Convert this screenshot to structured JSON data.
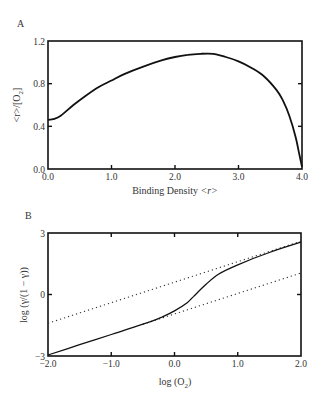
{
  "chart_data": [
    {
      "panel": "A",
      "type": "line",
      "title": "",
      "xlabel": "Binding Density <r>",
      "ylabel": "<r>/[O2]",
      "xlim": [
        0.0,
        4.0
      ],
      "ylim": [
        0.0,
        1.2
      ],
      "xticks": [
        "0.0",
        "1.0",
        "2.0",
        "3.0",
        "4.0"
      ],
      "yticks": [
        "0.0",
        "0.4",
        "0.8",
        "1.2"
      ],
      "grid": false,
      "series": [
        {
          "name": "Scatchard plot",
          "style": "solid",
          "x": [
            0.0,
            0.1,
            0.2,
            0.4,
            0.6,
            0.8,
            1.0,
            1.2,
            1.5,
            1.8,
            2.0,
            2.2,
            2.4,
            2.6,
            2.8,
            3.0,
            3.2,
            3.4,
            3.6,
            3.7,
            3.8,
            3.9,
            3.95,
            4.0
          ],
          "y": [
            0.46,
            0.47,
            0.5,
            0.6,
            0.69,
            0.77,
            0.83,
            0.89,
            0.96,
            1.02,
            1.05,
            1.07,
            1.08,
            1.08,
            1.05,
            1.01,
            0.95,
            0.87,
            0.74,
            0.64,
            0.5,
            0.3,
            0.16,
            0.02
          ]
        }
      ]
    },
    {
      "panel": "B",
      "type": "line",
      "title": "",
      "xlabel": "log (O2)",
      "ylabel": "log (Y/(1 − Y))",
      "xlim": [
        -2.0,
        2.0
      ],
      "ylim": [
        -3,
        3
      ],
      "xticks": [
        "−2.0",
        "−1.0",
        "0.0",
        "1.0",
        "2.0"
      ],
      "yticks": [
        "−3",
        "0",
        "3"
      ],
      "grid": false,
      "series": [
        {
          "name": "Hill plot",
          "style": "solid",
          "x": [
            -2.0,
            -1.5,
            -1.0,
            -0.5,
            -0.2,
            0.0,
            0.2,
            0.3,
            0.5,
            0.7,
            1.0,
            1.5,
            2.0
          ],
          "y": [
            -2.95,
            -2.45,
            -1.95,
            -1.45,
            -1.1,
            -0.8,
            -0.4,
            -0.1,
            0.5,
            1.0,
            1.45,
            2.05,
            2.55
          ]
        },
        {
          "name": "Upper asymptote (slope 1)",
          "style": "dotted",
          "x": [
            -2.0,
            2.0
          ],
          "y": [
            -1.4,
            2.6
          ]
        },
        {
          "name": "Lower asymptote (slope 1)",
          "style": "dotted",
          "x": [
            -0.5,
            2.0
          ],
          "y": [
            -1.45,
            1.05
          ]
        }
      ]
    }
  ],
  "panels": {
    "a": {
      "label": "A",
      "xlabel_text": "Binding Density ",
      "xlabel_var": "<r>",
      "ylabel_text": "<r>/[O",
      "ylabel_sub": "2",
      "ylabel_end": "]",
      "xticks": [
        "0.0",
        "1.0",
        "2.0",
        "3.0",
        "4.0"
      ],
      "yticks": [
        "0.0",
        "0.4",
        "0.8",
        "1.2"
      ]
    },
    "b": {
      "label": "B",
      "xlabel_text": "log (O",
      "xlabel_sub": "2",
      "xlabel_end": ")",
      "ylabel_text": "log (γ/(1 − γ))",
      "xticks": [
        "−2.0",
        "−1.0",
        "0.0",
        "1.0",
        "2.0"
      ],
      "yticks": [
        "−3",
        "0",
        "3"
      ]
    }
  }
}
